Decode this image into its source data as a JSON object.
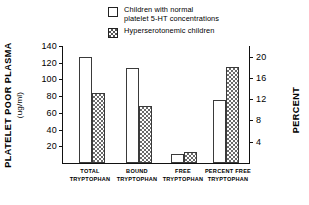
{
  "legend": {
    "entries": [
      {
        "swatch": "empty-square-swatch",
        "label": "Children with normal\nplatelet 5-HT concentrations"
      },
      {
        "swatch": "dotted-square-swatch",
        "label": "Hyperserotonemic children"
      }
    ]
  },
  "axes": {
    "left_title_main": "PLATELET POOR PLASMA",
    "left_title_sub": "(ug/ml)",
    "right_title": "PERCENT",
    "left_ticks": [
      "140",
      "120",
      "100",
      "80",
      "60",
      "40",
      "20"
    ],
    "right_ticks": [
      "20",
      "16",
      "12",
      "8",
      "4"
    ]
  },
  "chart_data": {
    "type": "bar",
    "title": "",
    "xlabel": "",
    "ylabel": "PLATELET POOR PLASMA (ug/ml)",
    "y2label": "PERCENT",
    "ylim": [
      0,
      140
    ],
    "y2lim": [
      0,
      22
    ],
    "yticks": [
      20,
      40,
      60,
      80,
      100,
      120,
      140
    ],
    "y2ticks": [
      4,
      8,
      12,
      16,
      20
    ],
    "grid": false,
    "legend_position": "top-center",
    "categories": [
      "TOTAL\nTRYPTOPHAN",
      "BOUND\nTRYPTOPHAN",
      "FREE\nTRYPTOPHAN",
      "PERCENT FREE\nTRYPTOPHAN"
    ],
    "category_axis": [
      "left",
      "left",
      "left",
      "right"
    ],
    "series": [
      {
        "name": "Children with normal platelet 5-HT concentrations",
        "style": "empty",
        "values": [
          127,
          114,
          11,
          59
        ],
        "values_right_axis": [
          null,
          null,
          null,
          11.8
        ]
      },
      {
        "name": "Hyperserotonemic children",
        "style": "dotted",
        "values": [
          84,
          68,
          13,
          90
        ],
        "values_right_axis": [
          null,
          null,
          null,
          18.0
        ]
      }
    ]
  }
}
